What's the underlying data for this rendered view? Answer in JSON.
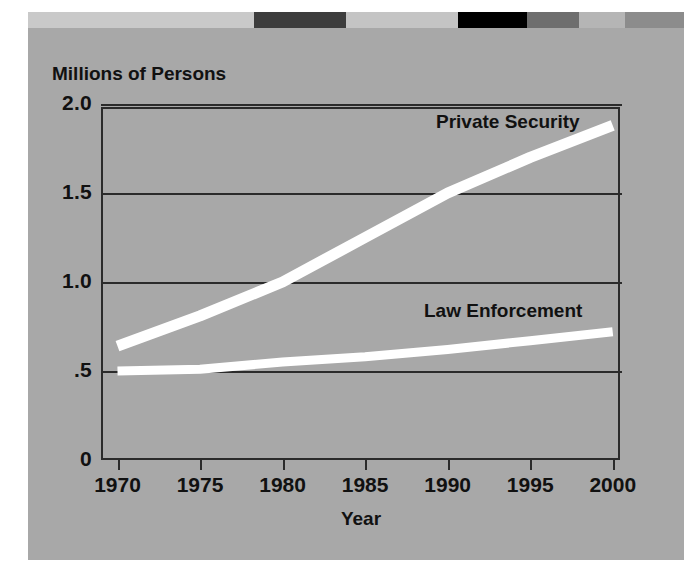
{
  "figure": {
    "panel_color": "#a8a8a8",
    "line_color": "#ffffff",
    "axis_color": "#2b2b2b",
    "text_color": "#111111"
  },
  "top_strip": [
    {
      "name": "segment-1",
      "color": "#c9c9c9",
      "width_pct": 34.5
    },
    {
      "name": "segment-2",
      "color": "#3d3d3d",
      "width_pct": 14.0
    },
    {
      "name": "segment-3",
      "color": "#c4c4c4",
      "width_pct": 17.0
    },
    {
      "name": "segment-4",
      "color": "#000000",
      "width_pct": 10.5
    },
    {
      "name": "segment-5",
      "color": "#6e6e6e",
      "width_pct": 8.0
    },
    {
      "name": "segment-6",
      "color": "#b5b5b5",
      "width_pct": 7.0
    },
    {
      "name": "segment-7",
      "color": "#8c8c8c",
      "width_pct": 9.0
    }
  ],
  "chart_data": {
    "type": "line",
    "title": "",
    "ylabel": "Millions of Persons",
    "xlabel": "Year",
    "grid": true,
    "legend_position": "inline-annotation",
    "xlim": [
      1969,
      2000.5
    ],
    "ylim": [
      0,
      2.0
    ],
    "ytick_labels": [
      "2.0",
      "1.5",
      "1.0",
      ".5",
      "0"
    ],
    "ytick_values": [
      2.0,
      1.5,
      1.0,
      0.5,
      0.0
    ],
    "xtick_labels": [
      "1970",
      "1975",
      "1980",
      "1985",
      "1990",
      "1995",
      "2000"
    ],
    "x": [
      1970,
      1975,
      1980,
      1985,
      1990,
      1995,
      2000
    ],
    "series": [
      {
        "name": "Private Security",
        "color": "#ffffff",
        "values": [
          0.64,
          0.81,
          1.0,
          1.25,
          1.5,
          1.7,
          1.88
        ]
      },
      {
        "name": "Law Enforcement",
        "color": "#ffffff",
        "values": [
          0.5,
          0.51,
          0.55,
          0.58,
          0.62,
          0.67,
          0.72
        ]
      }
    ]
  }
}
